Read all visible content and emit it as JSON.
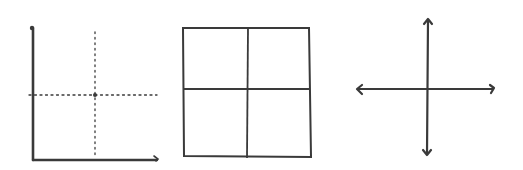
{
  "figure": {
    "colors": {
      "ink": "#3a3a3a",
      "background": "#ffffff"
    },
    "panels": [
      {
        "name": "first-quadrant-axes",
        "elements": [
          "y-axis",
          "x-axis",
          "dotted-vertical-midline",
          "dotted-horizontal-midline"
        ]
      },
      {
        "name": "four-quadrant-grid",
        "elements": [
          "outer-square",
          "vertical-divider",
          "horizontal-divider"
        ]
      },
      {
        "name": "cartesian-cross",
        "elements": [
          "vertical-double-arrow",
          "horizontal-double-arrow"
        ]
      }
    ]
  }
}
